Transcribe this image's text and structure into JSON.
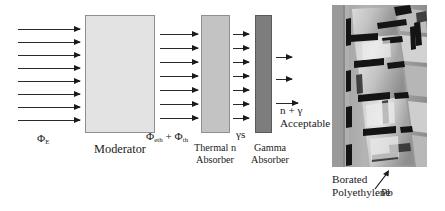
{
  "figure": {
    "type": "shielding-schematic"
  },
  "blocks": [
    {
      "id": "moderator",
      "label": "Moderator",
      "color": "#e3e3e3"
    },
    {
      "id": "thermal",
      "label_line1": "Thermal n",
      "label_line2": "Absorber",
      "color": "#c3c3c3"
    },
    {
      "id": "gamma",
      "label_line1": "Gamma",
      "label_line2": "Absorber",
      "color": "#7d7d7d"
    }
  ],
  "flux_labels": {
    "incident": "Φ",
    "incident_sub": "E",
    "after_moderator_1": "Φ",
    "after_moderator_sub1": "eth",
    "after_moderator_plus": " + ",
    "after_moderator_2": "Φ",
    "after_moderator_sub2": "th",
    "after_thermal": "γs",
    "output_line1": "n + γ",
    "output_line2": "Acceptable"
  },
  "arrow_groups": {
    "incident_count": 8,
    "post_moderator_count": 7,
    "post_thermal_count": 7,
    "output_count": 3
  },
  "photo_labels": {
    "material_line1": "Borated",
    "material_line2": "Polyethylene",
    "pb": "Pb"
  },
  "colors": {
    "arrow": "#1a1a1a",
    "moderator": "#e3e3e3",
    "thermal_absorber": "#c3c3c3",
    "gamma_absorber": "#7d7d7d",
    "border": "#8f8f8f",
    "text": "#1a1a1a"
  }
}
